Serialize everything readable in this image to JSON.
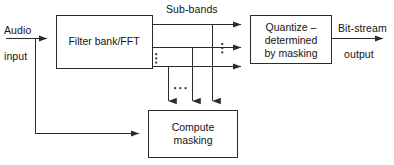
{
  "diagram": {
    "type": "block-diagram",
    "width": 394,
    "height": 165,
    "colors": {
      "background": "#ffffff",
      "stroke": "#2b2b2b",
      "text": "#141414"
    }
  },
  "labels": {
    "audio": "Audio",
    "input": "input",
    "sub_bands": "Sub-bands",
    "bit_stream": "Bit-stream",
    "output": "output"
  },
  "blocks": [
    {
      "id": "filter-bank",
      "label": "Filter bank/FFT",
      "lines": [
        "Filter bank/FFT"
      ],
      "x": 56,
      "y": 15,
      "w": 96,
      "h": 53
    },
    {
      "id": "quantize",
      "label": "Quantize – determined by masking",
      "lines": [
        "Quantize –",
        "determined",
        "by masking"
      ],
      "x": 250,
      "y": 15,
      "w": 82,
      "h": 48
    },
    {
      "id": "compute-masking",
      "label": "Compute masking",
      "lines": [
        "Compute",
        "masking"
      ],
      "x": 148,
      "y": 110,
      "w": 90,
      "h": 48
    }
  ],
  "block_text": {
    "filter_bank": "Filter bank/FFT",
    "quantize_line1": "Quantize –",
    "quantize_line2": "determined",
    "quantize_line3": "by masking",
    "compute_line1": "Compute",
    "compute_line2": "masking"
  },
  "connections": [
    {
      "id": "audio-in",
      "from": "audio input",
      "to": "filter-bank",
      "style": "arrow"
    },
    {
      "id": "audio-branch-to-masking",
      "from": "audio input",
      "to": "compute-masking",
      "style": "arrow"
    },
    {
      "id": "subband-1",
      "from": "filter-bank",
      "to": "quantize",
      "style": "arrow"
    },
    {
      "id": "subband-2",
      "from": "filter-bank",
      "to": "quantize",
      "style": "arrow"
    },
    {
      "id": "subband-3",
      "from": "filter-bank",
      "to": "quantize",
      "style": "arrow"
    },
    {
      "id": "subband-1-tap",
      "from": "subband-1",
      "to": "compute-masking",
      "style": "arrow"
    },
    {
      "id": "subband-2-tap",
      "from": "subband-2",
      "to": "compute-masking",
      "style": "arrow"
    },
    {
      "id": "subband-3-tap",
      "from": "subband-3",
      "to": "compute-masking",
      "style": "arrow"
    },
    {
      "id": "bitstream-out",
      "from": "quantize",
      "to": "bit-stream output",
      "style": "arrow"
    }
  ],
  "ellipses": [
    {
      "id": "subband-ellipsis-left",
      "orientation": "vertical",
      "x": 156,
      "y": 57
    },
    {
      "id": "subband-ellipsis-right",
      "orientation": "vertical",
      "x": 222,
      "y": 47
    },
    {
      "id": "masking-ellipsis",
      "orientation": "horizontal",
      "x": 180,
      "y": 88
    }
  ]
}
